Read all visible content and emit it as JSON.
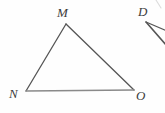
{
  "figure": {
    "background_color": "#fefefe",
    "stroke_color": "#555555",
    "label_color": "#3c3c3c",
    "width": 165,
    "height": 113,
    "labels": {
      "apex": "M",
      "bottom_left": "N",
      "bottom_right": "O",
      "partial_right": "D"
    },
    "shapes": {
      "triangle": {
        "name": "triangle-MNO",
        "vertices": [
          {
            "label": "M",
            "x": 66,
            "y": 24
          },
          {
            "label": "N",
            "x": 26,
            "y": 91
          },
          {
            "label": "O",
            "x": 134,
            "y": 90
          }
        ],
        "edges": [
          {
            "name": "MN",
            "from": "M",
            "to": "N"
          },
          {
            "name": "MO",
            "from": "M",
            "to": "O"
          },
          {
            "name": "NO",
            "from": "N",
            "to": "O"
          }
        ]
      },
      "partial_angle": {
        "name": "angle-D",
        "vertex": {
          "label": "D",
          "x": 146,
          "y": 22
        },
        "rays": [
          {
            "name": "ray-D-upper",
            "x1": 146,
            "y1": 22,
            "x2": 165,
            "y2": 32
          },
          {
            "name": "ray-D-lower",
            "x1": 146,
            "y1": 22,
            "x2": 165,
            "y2": 45
          }
        ]
      },
      "corner_mark": {
        "name": "corner-stray-mark",
        "x1": 155,
        "y1": 1,
        "x2": 161,
        "y2": 9
      }
    }
  }
}
